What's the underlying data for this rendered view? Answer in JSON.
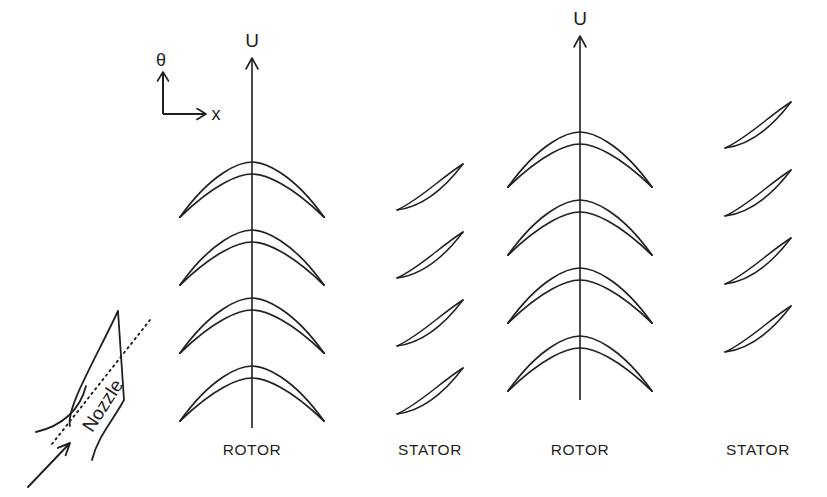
{
  "figure": {
    "background_color": "#ffffff",
    "line_color": "#231f20"
  },
  "axes_indicator": {
    "name": "coordinate-axes",
    "theta_label": "θ",
    "x_label": "x",
    "origin": {
      "x": 163,
      "y": 114
    },
    "theta_tip": {
      "x": 163,
      "y": 72
    },
    "x_tip": {
      "x": 206,
      "y": 114
    },
    "theta_label_pos": {
      "x": 161,
      "y": 66
    },
    "x_label_pos": {
      "x": 216,
      "y": 120
    }
  },
  "velocity_arrows": [
    {
      "name": "blade-speed-arrow-stage-1",
      "label": "U",
      "line_x": 252,
      "tip_y": 58,
      "bottom_y": 428,
      "label_pos": {
        "x": 252,
        "y": 47
      }
    },
    {
      "name": "blade-speed-arrow-stage-2",
      "label": "U",
      "line_x": 580,
      "tip_y": 36,
      "bottom_y": 400,
      "label_pos": {
        "x": 580,
        "y": 25
      }
    }
  ],
  "blade_rows": [
    {
      "name": "rotor-row-1",
      "type": "rotor",
      "label": "ROTOR",
      "label_pos": {
        "x": 252,
        "y": 455
      },
      "center_x": 252,
      "blade_count": 4,
      "first_blade_y": 196,
      "pitch": 68,
      "half_span": 72,
      "arch_height": 34,
      "camber_offset": 12
    },
    {
      "name": "stator-row-1",
      "type": "stator",
      "label": "STATOR",
      "label_pos": {
        "x": 430,
        "y": 455
      },
      "center_x": 430,
      "blade_count": 4,
      "first_blade_y": 210,
      "pitch": 68,
      "chord_dx": 66,
      "chord_dy": -46,
      "bow": 18,
      "thickness": 5.5
    },
    {
      "name": "rotor-row-2",
      "type": "rotor",
      "label": "ROTOR",
      "label_pos": {
        "x": 580,
        "y": 455
      },
      "center_x": 580,
      "blade_count": 4,
      "first_blade_y": 166,
      "pitch": 68,
      "half_span": 72,
      "arch_height": 34,
      "camber_offset": 12
    },
    {
      "name": "stator-row-2",
      "type": "stator",
      "label": "STATOR",
      "label_pos": {
        "x": 758,
        "y": 455
      },
      "center_x": 758,
      "blade_count": 4,
      "first_blade_y": 148,
      "pitch": 68,
      "chord_dx": 66,
      "chord_dy": -46,
      "bow": 18,
      "thickness": 5.5
    }
  ],
  "nozzle_detail": {
    "name": "nozzle-detail",
    "label": "Nozzle",
    "label_pos": {
      "x": 108,
      "y": 409
    },
    "label_rotation": -57,
    "apex": {
      "x": 118,
      "y": 311
    },
    "trailing_edge_bottom": {
      "x": 124,
      "y": 400
    },
    "leading_edge_mid": {
      "x": 84,
      "y": 380
    },
    "lower_tail": {
      "x": 92,
      "y": 460
    },
    "upper_wall_start": {
      "x": 36,
      "y": 432
    },
    "chord_start": {
      "x": 52,
      "y": 444
    },
    "chord_end": {
      "x": 150,
      "y": 320
    },
    "inflow_arrow_start": {
      "x": 28,
      "y": 487
    },
    "inflow_arrow_tip": {
      "x": 70,
      "y": 443
    }
  }
}
